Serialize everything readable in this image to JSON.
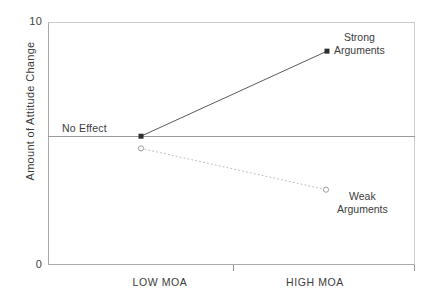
{
  "chart_data": {
    "type": "line",
    "title": "",
    "xlabel": "",
    "ylabel": "Amount of Attitude Change",
    "categories": [
      "LOW MOA",
      "HIGH MOA"
    ],
    "ylim": [
      0,
      10
    ],
    "yticks": [
      "0",
      "10"
    ],
    "grid": false,
    "legend_position": "inline-annotations",
    "reference_line": {
      "label": "No Effect",
      "value": 5.3
    },
    "series": [
      {
        "name": "Strong Arguments",
        "values": [
          5.3,
          8.8
        ],
        "style": "solid",
        "marker": "filled-square",
        "color": "#5a5a5a"
      },
      {
        "name": "Weak Arguments",
        "values": [
          4.8,
          3.1
        ],
        "style": "dotted",
        "marker": "open-circle",
        "color": "#b4b4b4"
      }
    ]
  },
  "axes": {
    "y_top_tick": "10",
    "y_bottom_tick": "0",
    "y_title": "Amount of Attitude Change",
    "x_tick_low": "LOW MOA",
    "x_tick_high": "HIGH MOA"
  },
  "annotations": {
    "no_effect": "No Effect",
    "strong_line1": "Strong",
    "strong_line2": "Arguments",
    "weak_line1": "Weak",
    "weak_line2": "Arguments"
  },
  "colors": {
    "strong_line": "#5a5a5a",
    "weak_line": "#b4b4b4",
    "reference_line": "#9a9a9a",
    "axis": "#aaaaaa",
    "text": "#3c3c3c",
    "background": "#ffffff"
  }
}
